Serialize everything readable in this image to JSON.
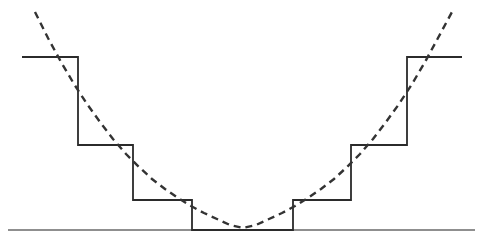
{
  "figure": {
    "background_color": "#ffffff",
    "width": 490,
    "height": 252
  },
  "chart_data": {
    "type": "line",
    "xlabel": "",
    "ylabel": "",
    "xlim": [
      0,
      490
    ],
    "ylim": [
      252,
      0
    ],
    "grid": false,
    "legend": null,
    "axis": {
      "name": "baseline-axis",
      "color": "#6a6a6a",
      "width": 1.6,
      "x_start": 8,
      "x_end": 475,
      "y": 230
    },
    "series": [
      {
        "name": "staircase",
        "style": "solid",
        "color": "#2b2b2b",
        "width": 1.8,
        "description": "Symmetric descending-then-ascending step function with 7 levels",
        "levels_y": [
          57,
          145,
          200,
          230,
          200,
          145,
          57
        ],
        "breakpoints_x": [
          22,
          78,
          133,
          192,
          293,
          351,
          407,
          462
        ],
        "points": [
          [
            22,
            57
          ],
          [
            78,
            57
          ],
          [
            78,
            145
          ],
          [
            133,
            145
          ],
          [
            133,
            200
          ],
          [
            192,
            200
          ],
          [
            192,
            230
          ],
          [
            293,
            230
          ],
          [
            293,
            200
          ],
          [
            351,
            200
          ],
          [
            351,
            145
          ],
          [
            407,
            145
          ],
          [
            407,
            57
          ],
          [
            462,
            57
          ]
        ]
      },
      {
        "name": "parabola",
        "style": "dashed",
        "color": "#333333",
        "width": 2.4,
        "dash_pattern": "7 5",
        "description": "Dashed parabola tangent to the baseline at its vertex",
        "vertex": [
          243,
          228
        ],
        "x_start": 35,
        "x_end": 452,
        "y_at_ends": 12,
        "points": [
          [
            35,
            12
          ],
          [
            48,
            38
          ],
          [
            61,
            62
          ],
          [
            74,
            84
          ],
          [
            87,
            104
          ],
          [
            100,
            122
          ],
          [
            113,
            139
          ],
          [
            126,
            154
          ],
          [
            139,
            167
          ],
          [
            152,
            179
          ],
          [
            165,
            189
          ],
          [
            178,
            198
          ],
          [
            191,
            206
          ],
          [
            204,
            213
          ],
          [
            217,
            219
          ],
          [
            230,
            225
          ],
          [
            243,
            228
          ],
          [
            256,
            225
          ],
          [
            269,
            219
          ],
          [
            282,
            213
          ],
          [
            295,
            206
          ],
          [
            308,
            198
          ],
          [
            321,
            189
          ],
          [
            334,
            179
          ],
          [
            347,
            167
          ],
          [
            360,
            154
          ],
          [
            373,
            139
          ],
          [
            386,
            122
          ],
          [
            399,
            104
          ],
          [
            412,
            84
          ],
          [
            425,
            62
          ],
          [
            438,
            38
          ],
          [
            452,
            12
          ]
        ]
      }
    ]
  }
}
